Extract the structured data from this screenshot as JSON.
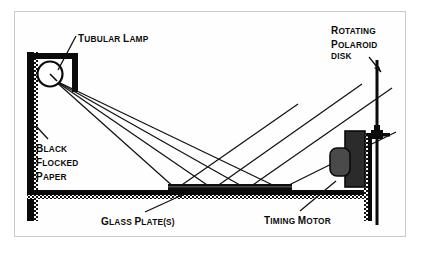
{
  "figure": {
    "type": "technical-line-diagram",
    "background_color": "#ffffff",
    "ink_color": "#000000",
    "frame_color": "#c9c9c9"
  },
  "labels": {
    "tubular_lamp": {
      "text": "TUBULAR LAMP",
      "first": "T",
      "rest": "UBULAR",
      "second": "L",
      "second_rest": "AMP"
    },
    "rotating_polaroid_disk": {
      "line1_first": "R",
      "line1_rest": "OTATING",
      "line2_first": "P",
      "line2_rest": "OLAROID",
      "line3": "DISK",
      "full": "ROTATING POLAROID DISK"
    },
    "black_flocked_paper": {
      "line1_first": "B",
      "line1_rest": "LACK",
      "line2_first": "F",
      "line2_rest": "LOCKED",
      "line3_first": "P",
      "line3_rest": "APER",
      "full": "BLACK FLOCKED PAPER"
    },
    "glass_plates": {
      "first": "G",
      "rest": "LASS",
      "second": "P",
      "second_rest": "LATE(S)",
      "full": "GLASS PLATE(S)"
    },
    "timing_motor": {
      "first": "T",
      "rest": "IMING",
      "second": "M",
      "second_rest": "OTOR",
      "full": "TIMING MOTOR"
    }
  },
  "components": {
    "lamp": {
      "name": "tubular lamp",
      "shape": "circle",
      "ray_count": 4
    },
    "lamp_hood": {
      "name": "reflector hood",
      "shape": "angle-bracket"
    },
    "left_wall": {
      "name": "black flocked paper wall",
      "orientation": "vertical"
    },
    "base": {
      "name": "black flocked paper base",
      "orientation": "horizontal"
    },
    "glass_plate": {
      "name": "glass plate stack",
      "orientation": "horizontal"
    },
    "right_wall": {
      "name": "black flocked paper wall right",
      "orientation": "vertical"
    },
    "timing_motor": {
      "name": "timing motor",
      "shape": "rounded-block"
    },
    "polaroid_disk": {
      "name": "rotating polaroid disk",
      "shape": "vertical-line-with-hub"
    }
  }
}
